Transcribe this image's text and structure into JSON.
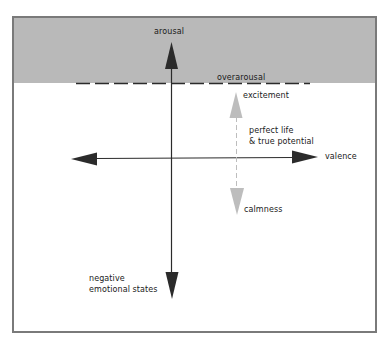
{
  "diagram": {
    "type": "arousal-valence model",
    "labels": {
      "arousal": "arousal",
      "overarousal": "overarousal",
      "excitement": "excitement",
      "perfect_life_line1": "perfect life",
      "perfect_life_line2": "& true potential",
      "valence": "valence",
      "calmness": "calmness",
      "negative_line1": "negative",
      "negative_line2": "emotional states"
    },
    "colors": {
      "overarousal_zone": "#b9b9b9",
      "frame_border": "#7a7a7a",
      "axis": "#2b2b2b",
      "optimal_range_arrow": "#bdbdbd",
      "dashed_threshold": "#2b2b2b"
    }
  }
}
